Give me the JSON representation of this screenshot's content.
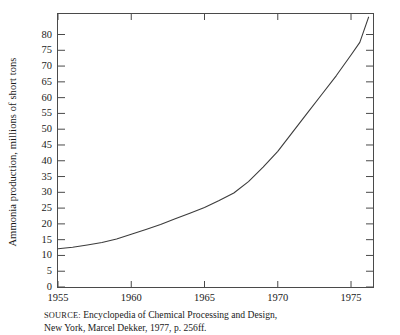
{
  "figure": {
    "ylabel": "Ammonia production, millions of short tons",
    "source_prefix": "SOURCE:",
    "source_line1": " Encyclopedia of Chemical Processing and Design,",
    "source_line2": "New York, Marcel Dekker, 1977, p. 256ff."
  },
  "chart_data": {
    "type": "line",
    "title": "",
    "xlabel": "",
    "ylabel": "Ammonia production, millions of short tons",
    "xlim": [
      1955,
      1976.5
    ],
    "ylim": [
      0,
      86.5
    ],
    "grid": false,
    "legend": false,
    "xticks": [
      1955,
      1960,
      1965,
      1970,
      1975
    ],
    "xtick_labels": [
      "1955",
      "1960",
      "1965",
      "1970",
      "1975"
    ],
    "yticks": [
      0,
      5,
      10,
      15,
      20,
      25,
      30,
      35,
      40,
      45,
      50,
      55,
      60,
      65,
      70,
      75,
      80
    ],
    "ytick_labels": [
      "0",
      "5",
      "10",
      "15",
      "20",
      "25",
      "30",
      "35",
      "40",
      "45",
      "50",
      "55",
      "60",
      "65",
      "70",
      "75",
      "80"
    ],
    "series": [
      {
        "name": "Ammonia production",
        "color": "#3c3c3c",
        "x": [
          1955,
          1956,
          1957,
          1958,
          1959,
          1960,
          1961,
          1962,
          1963,
          1964,
          1965,
          1966,
          1967,
          1968,
          1969,
          1970,
          1971,
          1972,
          1973,
          1974,
          1975,
          1975.6,
          1976.2
        ],
        "values": [
          12.1,
          12.6,
          13.3,
          14.1,
          15.2,
          16.7,
          18.2,
          19.8,
          21.6,
          23.4,
          25.2,
          27.4,
          29.8,
          33.4,
          38.0,
          43.0,
          49.0,
          55.0,
          61.0,
          67.0,
          73.5,
          77.5,
          85.5
        ]
      }
    ]
  }
}
